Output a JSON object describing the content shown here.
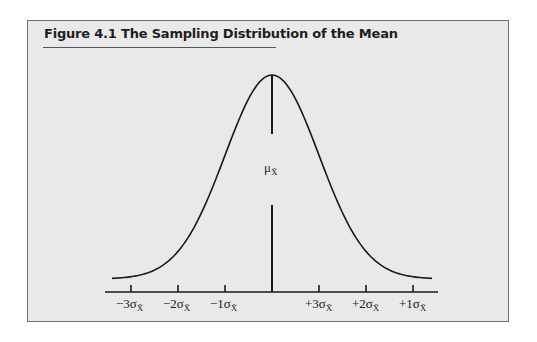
{
  "figure": {
    "title": "Figure 4.1  The Sampling Distribution of the Mean"
  },
  "chart_data": {
    "type": "line",
    "title": "Figure 4.1 The Sampling Distribution of the Mean",
    "center_label": "μX̄",
    "x_tick_labels": [
      "−3σX̄",
      "−2σX̄",
      "−1σX̄",
      "+3σX̄",
      "+2σX̄",
      "+1σX̄"
    ],
    "x_tick_positions_sd": [
      -3,
      -2,
      -1,
      1,
      2,
      3
    ],
    "xlabel": "",
    "ylabel": "",
    "grid": false,
    "legend": null
  },
  "labels": {
    "mu": "μ",
    "mu_sub": "X̄",
    "ticks": [
      {
        "prefix": "−3σ",
        "sub": "X̄"
      },
      {
        "prefix": "−2σ",
        "sub": "X̄"
      },
      {
        "prefix": "−1σ",
        "sub": "X̄"
      },
      {
        "prefix": "+3σ",
        "sub": "X̄"
      },
      {
        "prefix": "+2σ",
        "sub": "X̄"
      },
      {
        "prefix": "+1σ",
        "sub": "X̄"
      }
    ]
  }
}
